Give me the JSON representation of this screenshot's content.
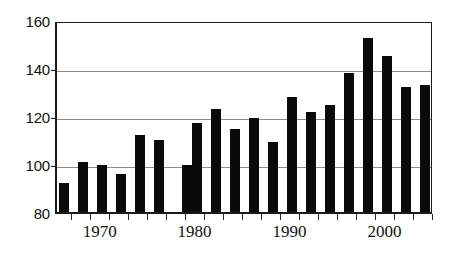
{
  "chart_data": {
    "type": "bar",
    "title": "",
    "subtitle": "",
    "xlabel": "",
    "ylabel": "",
    "xlim": [
      1965.3,
      2005.0
    ],
    "ylim": [
      80,
      160
    ],
    "grid": "horizontal",
    "legend": "none",
    "bar_color": "#0a0a0a",
    "axis_color": "#1a1a1a",
    "gridline_color": "#8c8c8c",
    "y_ticks": [
      80,
      100,
      120,
      140,
      160
    ],
    "y_tick_labels": [
      "80",
      "100",
      "120",
      "140",
      "160"
    ],
    "x_tick_years": [
      1966,
      1968,
      1970,
      1972,
      1974,
      1976,
      1978,
      1980,
      1982,
      1984,
      1986,
      1988,
      1990,
      1992,
      1994,
      1996,
      1998,
      2000,
      2002,
      2004
    ],
    "x_labels": [
      {
        "text": "1970",
        "year": 1970
      },
      {
        "text": "1980",
        "year": 1980
      },
      {
        "text": "1990",
        "year": 1990
      },
      {
        "text": "2000",
        "year": 2000
      }
    ],
    "categories": [
      1966,
      1967,
      1968,
      1969,
      1970,
      1971,
      1972,
      1973,
      1974,
      1975,
      1976,
      1977,
      1978,
      1979,
      1980,
      1981,
      1982,
      1983,
      1984,
      1985,
      1986,
      1987,
      1988,
      1989,
      1990,
      1991,
      1992,
      1993,
      1994,
      1995,
      1996,
      1997,
      1998,
      1999,
      2000,
      2001,
      2002,
      2003,
      2004
    ],
    "values": [
      92,
      101,
      99.5,
      96,
      112,
      110,
      99.5,
      117,
      123,
      114.5,
      119,
      109,
      128,
      121.5,
      124.5,
      138,
      152.5,
      145,
      132,
      133,
      92,
      101,
      99.5,
      96,
      112,
      110,
      99.5,
      117,
      123,
      114.5,
      119,
      109,
      128,
      121.5,
      124.5,
      138,
      152.5,
      145,
      132
    ],
    "bars": [
      {
        "year": 1966,
        "value": 92
      },
      {
        "year": 1968,
        "value": 101
      },
      {
        "year": 1970,
        "value": 99.5
      },
      {
        "year": 1972,
        "value": 96
      },
      {
        "year": 1974,
        "value": 112
      },
      {
        "year": 1976,
        "value": 110
      },
      {
        "year": 1979,
        "value": 99.5
      },
      {
        "year": 1980,
        "value": 117
      },
      {
        "year": 1982,
        "value": 123
      },
      {
        "year": 1984,
        "value": 114.5
      },
      {
        "year": 1986,
        "value": 119
      },
      {
        "year": 1988,
        "value": 109
      },
      {
        "year": 1990,
        "value": 128
      },
      {
        "year": 1992,
        "value": 121.5
      },
      {
        "year": 1994,
        "value": 124.5
      },
      {
        "year": 1996,
        "value": 138
      },
      {
        "year": 1998,
        "value": 152.5
      },
      {
        "year": 2000,
        "value": 145
      },
      {
        "year": 2002,
        "value": 132
      },
      {
        "year": 2004,
        "value": 133
      }
    ]
  }
}
